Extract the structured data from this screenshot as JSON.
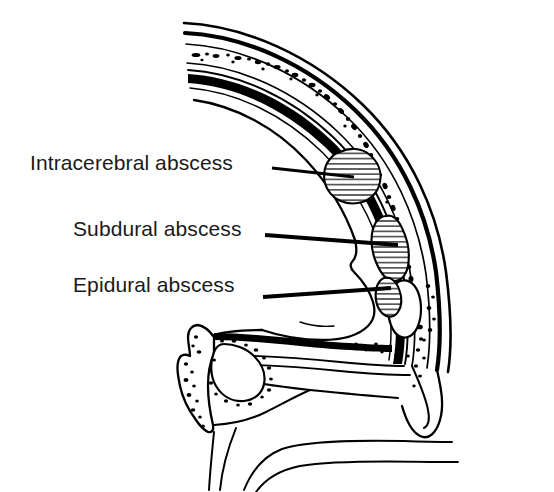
{
  "figure": {
    "background_color": "#ffffff",
    "ink_color": "#000000",
    "width": 554,
    "height": 492
  },
  "labels": [
    {
      "id": "intracerebral",
      "text": "Intracerebral abscess",
      "text_x": 30,
      "text_y": 170,
      "leader": {
        "x1": 272,
        "y1": 168,
        "x2": 352,
        "y2": 177
      },
      "target": {
        "cx": 358,
        "cy": 175
      }
    },
    {
      "id": "subdural",
      "text": "Subdural abscess",
      "text_x": 73,
      "text_y": 236,
      "leader": {
        "x1": 265,
        "y1": 235,
        "x2": 398,
        "y2": 245
      },
      "target": {
        "cx": 402,
        "cy": 246
      }
    },
    {
      "id": "epidural",
      "text": "Epidural abscess",
      "text_x": 73,
      "text_y": 292,
      "leader": {
        "x1": 263,
        "y1": 297,
        "x2": 390,
        "y2": 288
      },
      "target": {
        "cx": 394,
        "cy": 288
      }
    }
  ],
  "anatomy": {
    "layers": [
      "scalp",
      "outer-table",
      "diploe",
      "inner-table",
      "dura-mater",
      "brain"
    ],
    "structures": [
      "skull-vault",
      "frontal-sinus",
      "sphenoid-sinus",
      "facial-profile",
      "mastoid-bone"
    ]
  },
  "abscesses": [
    {
      "id": "intracerebral",
      "location": "within brain parenchyma",
      "fill_pattern": "horizontal-hatch"
    },
    {
      "id": "subdural",
      "location": "between dura and brain",
      "fill_pattern": "horizontal-hatch"
    },
    {
      "id": "epidural",
      "location": "outside dura, against inner table",
      "fill_pattern": "horizontal-hatch"
    }
  ]
}
